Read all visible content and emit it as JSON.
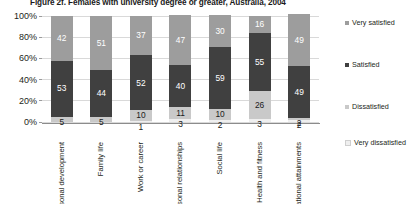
{
  "title": "Figure 2f. Females with university degree or greater, Australia, 2004",
  "axis": {
    "y_ticks": [
      "100%",
      "80%",
      "60%",
      "40%",
      "20%",
      "0%"
    ],
    "y_min": 0,
    "y_max": 100
  },
  "legend": {
    "items": [
      {
        "label": "Very satisfied",
        "color": "#9d9d9d",
        "key": "very-satisfied"
      },
      {
        "label": "Satisfied",
        "color": "#404040",
        "key": "satisfied"
      },
      {
        "label": "Dissatisfied",
        "color": "#c9c9c9",
        "key": "dissatisfied"
      },
      {
        "label": "Very dissatisfied",
        "color": "#efefef",
        "key": "very-dissatisfied"
      }
    ]
  },
  "chart_data": {
    "type": "bar",
    "stacked": true,
    "stack_total": 100,
    "title": "Figure 2f. Females with university degree or greater, Australia, 2004",
    "xlabel": "",
    "ylabel": "",
    "ylim": [
      0,
      100
    ],
    "ytick_labels": [
      "0%",
      "20%",
      "40%",
      "60%",
      "80%",
      "100%"
    ],
    "grid": true,
    "legend_position": "right",
    "categories": [
      "Personal development",
      "Family life",
      "Work or career",
      "Personal relationships",
      "Social life",
      "Health and fitness",
      "My educational attainments"
    ],
    "series": [
      {
        "name": "Very satisfied",
        "color": "#9d9d9d",
        "values": [
          42,
          51,
          37,
          47,
          30,
          16,
          49
        ]
      },
      {
        "name": "Satisfied",
        "color": "#404040",
        "values": [
          53,
          44,
          52,
          40,
          59,
          55,
          49
        ]
      },
      {
        "name": "Dissatisfied",
        "color": "#c9c9c9",
        "values": [
          5,
          5,
          10,
          11,
          10,
          26,
          2
        ]
      },
      {
        "name": "Very dissatisfied",
        "color": "#efefef",
        "values": [
          0,
          0,
          1,
          3,
          2,
          3,
          2
        ]
      }
    ]
  }
}
